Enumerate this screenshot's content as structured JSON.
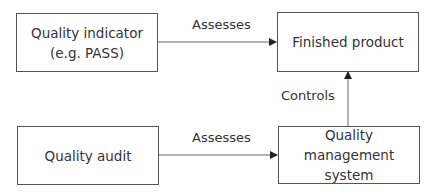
{
  "diagram": {
    "nodes": [
      {
        "id": "quality-indicator",
        "lines": [
          "Quality indicator",
          "(e.g. PASS)"
        ]
      },
      {
        "id": "finished-product",
        "lines": [
          "Finished product"
        ]
      },
      {
        "id": "quality-audit",
        "lines": [
          "Quality audit"
        ]
      },
      {
        "id": "quality-management-system",
        "lines": [
          "Quality management",
          "system"
        ]
      }
    ],
    "edges": [
      {
        "from": "quality-indicator",
        "to": "finished-product",
        "label": "Assesses"
      },
      {
        "from": "quality-audit",
        "to": "quality-management-system",
        "label": "Assesses"
      },
      {
        "from": "quality-management-system",
        "to": "finished-product",
        "label": "Controls"
      }
    ],
    "colors": {
      "stroke": "#555555",
      "text": "#333333",
      "background": "#ffffff"
    }
  }
}
